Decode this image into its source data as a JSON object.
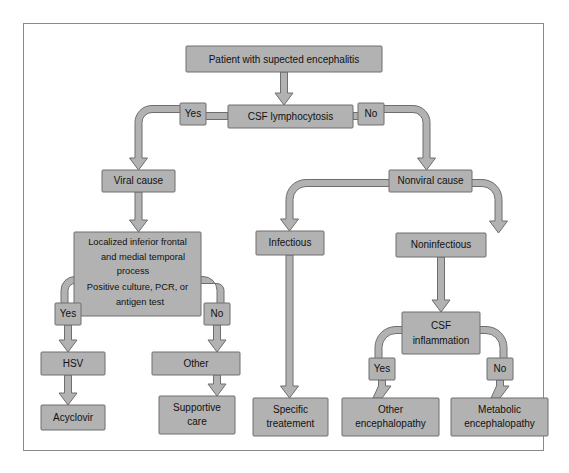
{
  "figure": {
    "type": "flowchart",
    "frame": {
      "border_color": "#8a8a8a",
      "background": "#ffffff"
    },
    "style": {
      "node_fill": "#b2b2b2",
      "node_stroke": "#6e6e6e",
      "connector_fill": "#b2b2b2",
      "text_color": "#111111"
    }
  },
  "nodes": {
    "start": {
      "label": "Patient with supected encephalitis"
    },
    "csf_lymphocytosis": {
      "label": "CSF lymphocytosis"
    },
    "viral_cause": {
      "label": "Viral cause"
    },
    "nonviral_cause": {
      "label": "Nonviral cause"
    },
    "localized_criteria": {
      "line1": "Localized inferior frontal",
      "line2": "and medial temporal",
      "line3": "process",
      "line4": "Positive culture, PCR, or",
      "line5": "antigen test"
    },
    "infectious": {
      "label": "Infectious"
    },
    "noninfectious": {
      "label": "Noninfectious"
    },
    "csf_inflammation": {
      "line1": "CSF",
      "line2": "inflammation"
    },
    "hsv": {
      "label": "HSV"
    },
    "other": {
      "label": "Other"
    },
    "acyclovir": {
      "label": "Acyclovir"
    },
    "supportive_care": {
      "line1": "Supportive",
      "line2": "care"
    },
    "specific_treatment": {
      "line1": "Specific",
      "line2": "treatement"
    },
    "other_encephalopathy": {
      "line1": "Other",
      "line2": "encephalopathy"
    },
    "metabolic_encephalopathy": {
      "line1": "Metabolic",
      "line2": "encephalopathy"
    }
  },
  "branch_labels": {
    "csf_yes": "Yes",
    "csf_no": "No",
    "localized_yes": "Yes",
    "localized_no": "No",
    "inflammation_yes": "Yes",
    "inflammation_no": "No"
  },
  "edges": [
    {
      "from": "start",
      "to": "csf_lymphocytosis",
      "label": ""
    },
    {
      "from": "csf_lymphocytosis",
      "to": "viral_cause",
      "label": "Yes"
    },
    {
      "from": "csf_lymphocytosis",
      "to": "nonviral_cause",
      "label": "No"
    },
    {
      "from": "viral_cause",
      "to": "localized_criteria",
      "label": ""
    },
    {
      "from": "localized_criteria",
      "to": "hsv",
      "label": "Yes"
    },
    {
      "from": "localized_criteria",
      "to": "other",
      "label": "No"
    },
    {
      "from": "hsv",
      "to": "acyclovir",
      "label": ""
    },
    {
      "from": "other",
      "to": "supportive_care",
      "label": ""
    },
    {
      "from": "nonviral_cause",
      "to": "infectious",
      "label": ""
    },
    {
      "from": "nonviral_cause",
      "to": "noninfectious",
      "label": ""
    },
    {
      "from": "infectious",
      "to": "specific_treatment",
      "label": ""
    },
    {
      "from": "noninfectious",
      "to": "csf_inflammation",
      "label": ""
    },
    {
      "from": "csf_inflammation",
      "to": "other_encephalopathy",
      "label": "Yes"
    },
    {
      "from": "csf_inflammation",
      "to": "metabolic_encephalopathy",
      "label": "No"
    }
  ]
}
